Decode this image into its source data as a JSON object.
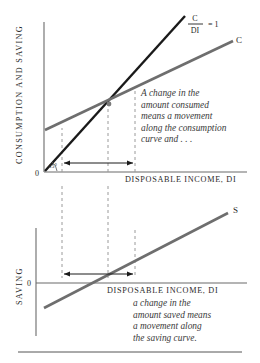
{
  "figure": {
    "top_chart": {
      "y_axis_label": "CONSUMPTION AND SAVING",
      "x_axis_label": "DISPOSABLE INCOME, DI",
      "origin_label": "0",
      "angle_label": "45°",
      "ratio_numerator": "C",
      "ratio_denominator": "DI",
      "ratio_equals": "= 1",
      "consumption_curve_label": "C",
      "note": "A change in the\namount consumed\nmeans a movement\nalong the consumption\ncurve and . . ."
    },
    "bottom_chart": {
      "y_axis_label": "SAVING",
      "x_axis_label": "DISPOSABLE INCOME, DI",
      "origin_label": "0",
      "saving_curve_label": "S",
      "note": "a change in the\namount saved means\na movement along\nthe saving curve."
    },
    "colors": {
      "axis": "#6b6b6b",
      "curve_gray": "#6e6e6e",
      "curve_black": "#1a1a1a",
      "dashed": "#9a9a9a",
      "text": "#2a2a2a",
      "note_text": "#3a3a3a",
      "rule": "#555555",
      "background": "#ffffff"
    }
  }
}
